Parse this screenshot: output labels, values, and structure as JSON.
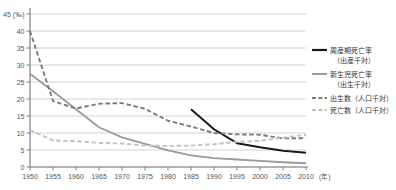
{
  "chart_data": {
    "type": "line",
    "title": "",
    "xlabel": "(年)",
    "ylabel": "(‰)",
    "xlim": [
      1950,
      2010
    ],
    "ylim": [
      0,
      45
    ],
    "ytick_step": 5,
    "grid": true,
    "legend_position": "right",
    "yticks": [
      "0",
      "5",
      "10",
      "15",
      "20",
      "25",
      "30",
      "35",
      "40",
      "45"
    ],
    "y_unit": "(‰)",
    "x_unit": "(年)",
    "categories": [
      1950,
      1955,
      1960,
      1965,
      1970,
      1975,
      1980,
      1985,
      1990,
      1995,
      2000,
      2005,
      2010
    ],
    "series": [
      {
        "name": "周産期死亡率",
        "sub": "(出産千対)",
        "legend_line1": "周産期死亡率",
        "legend_line2": "（出産千対）",
        "style": "solid",
        "color": "#1a1a1a",
        "width": 2.0,
        "x": [
          1985,
          1990,
          1995,
          2000,
          2005,
          2010
        ],
        "values": [
          17.0,
          11.1,
          7.0,
          5.8,
          4.8,
          4.2
        ]
      },
      {
        "name": "新生児死亡率",
        "sub": "(出生千対)",
        "legend_line1": "新生児死亡率",
        "legend_line2": "（出生千対）",
        "style": "solid",
        "color": "#9a9a9a",
        "width": 1.8,
        "x": [
          1950,
          1955,
          1960,
          1965,
          1970,
          1975,
          1980,
          1985,
          1990,
          1995,
          2000,
          2005,
          2010
        ],
        "values": [
          27.4,
          22.3,
          17.0,
          11.7,
          8.7,
          6.8,
          4.9,
          3.4,
          2.6,
          2.2,
          1.8,
          1.4,
          1.1
        ]
      },
      {
        "name": "出生数（人口千対）",
        "sub": "",
        "legend_line1": "出生数（人口千対）",
        "legend_line2": "",
        "style": "dashed",
        "color": "#7a7a7a",
        "width": 1.9,
        "x": [
          1950,
          1955,
          1960,
          1965,
          1970,
          1975,
          1980,
          1985,
          1990,
          1995,
          2000,
          2005,
          2010
        ],
        "values": [
          40.0,
          19.4,
          17.2,
          18.6,
          18.8,
          17.1,
          13.6,
          11.9,
          10.0,
          9.6,
          9.5,
          8.4,
          8.5
        ]
      },
      {
        "name": "死亡数（人口千対）",
        "sub": "",
        "legend_line1": "死亡数（人口千対）",
        "legend_line2": "",
        "style": "dashed",
        "color": "#c2c2c2",
        "width": 1.9,
        "x": [
          1950,
          1955,
          1960,
          1965,
          1970,
          1975,
          1980,
          1985,
          1990,
          1995,
          2000,
          2005,
          2010
        ],
        "values": [
          10.9,
          7.8,
          7.6,
          7.1,
          6.9,
          6.3,
          6.2,
          6.3,
          6.7,
          7.4,
          7.7,
          8.6,
          9.5
        ]
      }
    ]
  },
  "axis": {
    "y_top_label": "45 (‰)",
    "y_labels": [
      "45 (‰)",
      "40",
      "35",
      "30",
      "25",
      "20",
      "15",
      "10",
      "5",
      "0"
    ],
    "x_labels": [
      "1950",
      "1955",
      "1960",
      "1965",
      "1970",
      "1975",
      "1980",
      "1985",
      "1990",
      "1995",
      "2000",
      "2005",
      "2010"
    ],
    "x_unit_suffix": "(年)"
  },
  "legend": {
    "items": [
      {
        "label_top": "周産期死亡率",
        "label_bottom": "（出産千対）",
        "swatch": "solid-dark"
      },
      {
        "label_top": "新生児死亡率",
        "label_bottom": "（出生千対）",
        "swatch": "solid-gray"
      },
      {
        "label_top": "出生数（人口千対）",
        "label_bottom": "",
        "swatch": "dashed-dark"
      },
      {
        "label_top": "死亡数（人口千対）",
        "label_bottom": "",
        "swatch": "dashed-light"
      }
    ]
  },
  "colors": {
    "perinatal": "#1a1a1a",
    "neonatal": "#9a9a9a",
    "birth": "#7a7a7a",
    "death": "#c2c2c2",
    "grid": "#c8c8c8",
    "axis": "#808080",
    "text": "#555555",
    "background": "#ffffff"
  }
}
